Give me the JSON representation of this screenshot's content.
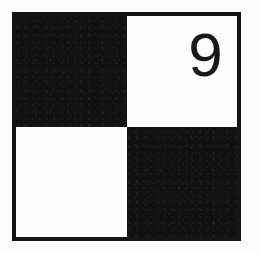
{
  "figure": {
    "kind": "checkerboard-tile",
    "label": "2x2 black and white checkerboard with numeral",
    "border_color": "#151515",
    "black_color": "#111111",
    "white_color": "#ffffff",
    "background_color": "#fefefe"
  },
  "quadrants": [
    {
      "position": "top-left",
      "fill": "black",
      "text": ""
    },
    {
      "position": "top-right",
      "fill": "white",
      "text": "9"
    },
    {
      "position": "bottom-left",
      "fill": "white",
      "text": ""
    },
    {
      "position": "bottom-right",
      "fill": "black",
      "text": ""
    }
  ],
  "number": {
    "value": "9"
  }
}
